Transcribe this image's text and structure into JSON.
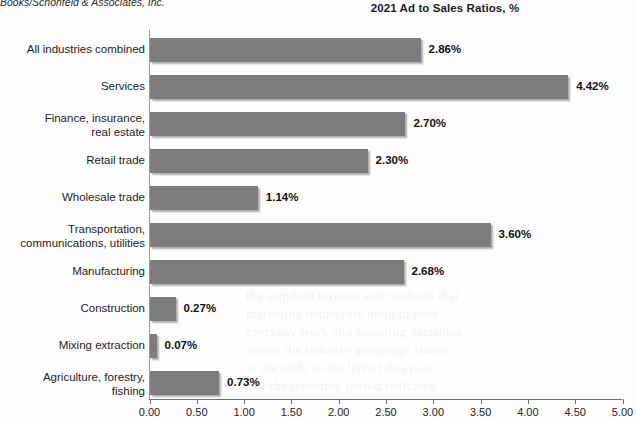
{
  "source_credit": "Books/Schonfeld & Associates, Inc.",
  "chart_data": {
    "type": "bar",
    "orientation": "horizontal",
    "title": "2021 Ad to Sales Ratios, %",
    "xlabel": "",
    "ylabel": "",
    "xlim": [
      0.0,
      5.0
    ],
    "xtick_step": 0.5,
    "grid": false,
    "legend": "none",
    "bar_color": "#7d7d7d",
    "categories": [
      "All industries combined",
      "Services",
      "Finance, insurance,\nreal estate",
      "Retail trade",
      "Wholesale trade",
      "Transportation,\ncommunications, utilities",
      "Manufacturing",
      "Construction",
      "Mixing extraction",
      "Agriculture, forestry,\nfishing"
    ],
    "values": [
      2.86,
      4.42,
      2.7,
      2.3,
      1.14,
      3.6,
      2.68,
      0.27,
      0.07,
      0.73
    ],
    "value_labels": [
      "2.86%",
      "4.42%",
      "2.70%",
      "2.30%",
      "1.14%",
      "3.60%",
      "2.68%",
      "0.27%",
      "0.07%",
      "0.73%"
    ],
    "xticks": [
      0.0,
      0.5,
      1.0,
      1.5,
      2.0,
      2.5,
      3.0,
      3.5,
      4.0,
      4.5,
      5.0
    ],
    "xtick_labels": [
      "0.00",
      "0.50",
      "1.00",
      "1.50",
      "2.00",
      "2.50",
      "3.00",
      "3.50",
      "4.00",
      "4.50",
      "5.00"
    ]
  }
}
